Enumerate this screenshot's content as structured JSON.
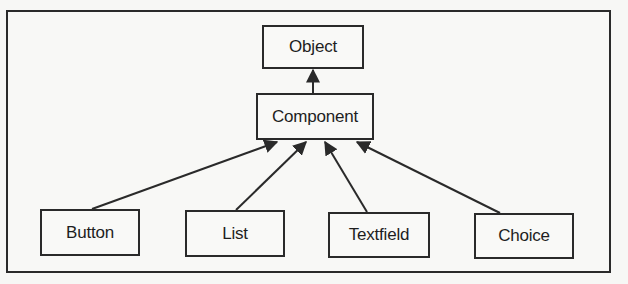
{
  "diagram": {
    "type": "class-hierarchy",
    "colors": {
      "line": "#2a2a2a",
      "text": "#1e1e1e",
      "background": "#f8f8f6"
    },
    "nodes": {
      "object": {
        "label": "Object"
      },
      "component": {
        "label": "Component"
      },
      "button": {
        "label": "Button"
      },
      "list": {
        "label": "List"
      },
      "textfield": {
        "label": "Textfield"
      },
      "choice": {
        "label": "Choice"
      }
    },
    "edges": [
      {
        "from": "component",
        "to": "object",
        "kind": "inherits"
      },
      {
        "from": "button",
        "to": "component",
        "kind": "inherits"
      },
      {
        "from": "list",
        "to": "component",
        "kind": "inherits"
      },
      {
        "from": "textfield",
        "to": "component",
        "kind": "inherits"
      },
      {
        "from": "choice",
        "to": "component",
        "kind": "inherits"
      }
    ]
  }
}
